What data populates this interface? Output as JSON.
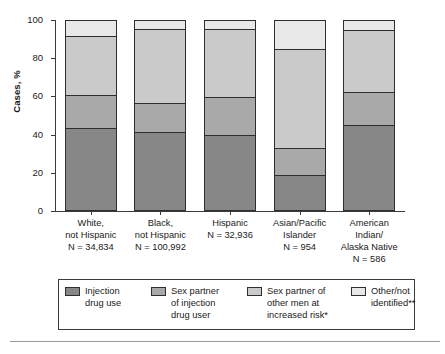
{
  "chart_data": {
    "type": "bar",
    "subtype": "stacked-100-percent",
    "title": "",
    "xlabel": "",
    "ylabel": "Cases, %",
    "ylim": [
      0,
      100
    ],
    "yticks": [
      0,
      20,
      40,
      60,
      80,
      100
    ],
    "ytick_labels": [
      "0",
      "20",
      "40",
      "60",
      "80",
      "100"
    ],
    "grid": false,
    "legend_position": "bottom",
    "categories": [
      "White,\nnot Hispanic\nN = 34,834",
      "Black,\nnot Hispanic\nN = 100,992",
      "Hispanic\nN = 32,936",
      "Asian/Pacific\nIslander\nN = 954",
      "American\nIndian/\nAlaska Native\nN = 586"
    ],
    "category_names": [
      "White, not Hispanic",
      "Black, not Hispanic",
      "Hispanic",
      "Asian/Pacific Islander",
      "American Indian/Alaska Native"
    ],
    "category_counts": [
      "N = 34,834",
      "N = 100,992",
      "N = 32,936",
      "N = 954",
      "N = 586"
    ],
    "series": [
      {
        "name": "Injection\ndrug use",
        "color": "#878787",
        "values": [
          43.5,
          41.0,
          39.5,
          18.5,
          45.0
        ]
      },
      {
        "name": "Sex partner\nof injection\ndrug user",
        "color": "#a9a9a9",
        "values": [
          17.5,
          15.5,
          20.5,
          14.5,
          17.5
        ]
      },
      {
        "name": "Sex partner of\nother men at\nincreased risk*",
        "color": "#cacaca",
        "values": [
          31.0,
          39.5,
          36.0,
          52.0,
          32.5
        ]
      },
      {
        "name": "Other/not\nidentified**",
        "color": "#e8e8e8",
        "values": [
          8.0,
          4.0,
          4.0,
          15.0,
          5.0
        ]
      }
    ],
    "cumulative_boundaries": [
      [
        43.5,
        61.0,
        92.0,
        100
      ],
      [
        41.0,
        56.5,
        96.0,
        100
      ],
      [
        39.5,
        60.0,
        96.0,
        100
      ],
      [
        18.5,
        33.0,
        85.0,
        100
      ],
      [
        45.0,
        62.5,
        95.0,
        100
      ]
    ]
  },
  "axis": {
    "y_title": "Cases, %"
  },
  "legend": {
    "items": [
      {
        "label": "Injection\ndrug use",
        "color": "#878787"
      },
      {
        "label": "Sex partner\nof injection\ndrug user",
        "color": "#a9a9a9"
      },
      {
        "label": "Sex partner of\nother men at\nincreased risk*",
        "color": "#cacaca"
      },
      {
        "label": "Other/not\nidentified**",
        "color": "#e8e8e8"
      }
    ]
  },
  "colors": {
    "axis": "#3b3b3b",
    "bar_outline": "#2e2e2e",
    "background": "#ffffff",
    "rule": "#9a9a9a"
  }
}
